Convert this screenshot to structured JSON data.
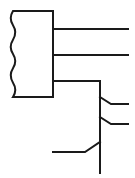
{
  "figure": {
    "background_color": "#ffffff",
    "line_color": "#1a1a1a",
    "canvas": {
      "width": 135,
      "height": 178
    },
    "caption": ""
  },
  "cable_block": {
    "label": "cable-body",
    "description": "Rectangular cable body with torn / broken left edge",
    "x": 13,
    "y": 11,
    "width": 40,
    "height": 86,
    "stroke_width": 2,
    "break_edge_side": "left",
    "break_edge_wave_amplitude": 3
  },
  "conductors": [
    {
      "name": "conductor-1",
      "exit_y": 29,
      "start_x": 53,
      "end_x": 128,
      "stroke_width": 2
    },
    {
      "name": "conductor-2",
      "exit_y": 55,
      "start_x": 53,
      "end_x": 128,
      "stroke_width": 2
    },
    {
      "name": "conductor-3",
      "exit_y": 81,
      "start_x": 53,
      "end_x": 100,
      "stroke_width": 2
    }
  ],
  "bus": {
    "name": "vertical-bus",
    "x": 100,
    "top_y": 81,
    "bottom_y": 173,
    "stroke_width": 2
  },
  "taps": [
    {
      "name": "tap-1",
      "junction_y": 97,
      "elbow_x": 111,
      "elbow_y": 104,
      "end_x": 128,
      "stroke_width": 2
    },
    {
      "name": "tap-2",
      "junction_y": 117,
      "elbow_x": 111,
      "elbow_y": 124,
      "end_x": 128,
      "stroke_width": 2
    }
  ],
  "bottom_lead": {
    "name": "bottom-lead",
    "junction_y": 142,
    "elbow_x": 85,
    "elbow_y": 152,
    "end_x": 53,
    "stroke_width": 2
  }
}
